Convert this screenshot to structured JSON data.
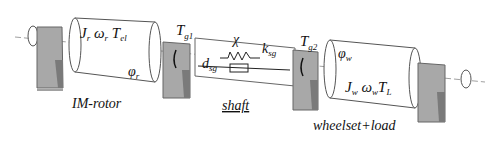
{
  "diagram": {
    "rotor": {
      "J": "J",
      "J_sub": "r",
      "omega": "ω",
      "omega_sub": "r",
      "T": "T",
      "T_sub": "el",
      "phi": "φ",
      "phi_sub": "r",
      "caption": "IM-rotor"
    },
    "gear1": {
      "T": "T",
      "T_sub": "g1"
    },
    "shaft": {
      "chi": "χ",
      "k": "k",
      "k_sub": "sg",
      "d": "d",
      "d_sub": "sg",
      "caption": "shaft"
    },
    "gear2": {
      "T": "T",
      "T_sub": "g2"
    },
    "wheelset": {
      "J": "J",
      "J_sub": "w",
      "omega": "ω",
      "omega_sub": "w",
      "T": "T",
      "T_sub": "L",
      "phi": "φ",
      "phi_sub": "w",
      "caption": "wheelset+load"
    },
    "colors": {
      "support": "#a8a8a8",
      "support_dark": "#7a7a7a",
      "line": "#222222"
    }
  }
}
